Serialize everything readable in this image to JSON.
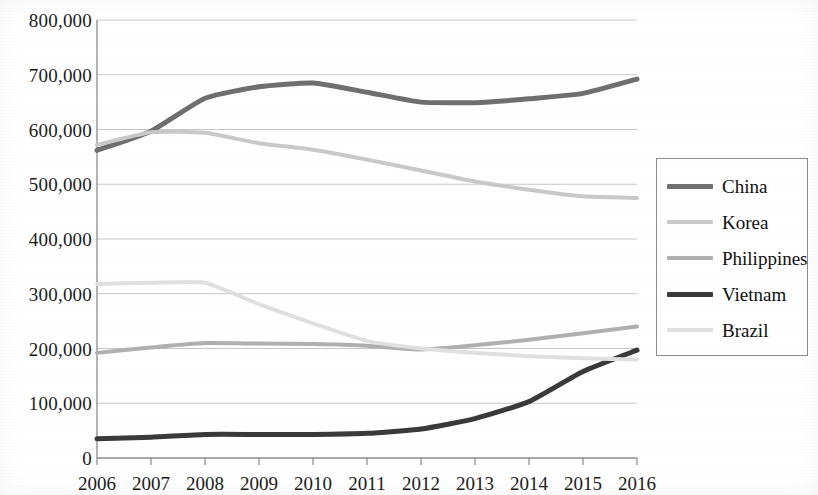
{
  "chart_data": {
    "type": "line",
    "title": "",
    "xlabel": "",
    "ylabel": "",
    "x": [
      2006,
      2007,
      2008,
      2009,
      2010,
      2011,
      2012,
      2013,
      2014,
      2015,
      2016
    ],
    "categories": [
      "2006",
      "2007",
      "2008",
      "2009",
      "2010",
      "2011",
      "2012",
      "2013",
      "2014",
      "2015",
      "2016"
    ],
    "xlim": [
      2006,
      2016
    ],
    "ylim": [
      0,
      800000
    ],
    "y_ticks": [
      0,
      100000,
      200000,
      300000,
      400000,
      500000,
      600000,
      700000,
      800000
    ],
    "y_tick_labels": [
      "0",
      "100,000",
      "200,000",
      "300,000",
      "400,000",
      "500,000",
      "600,000",
      "700,000",
      "800,000"
    ],
    "grid": true,
    "legend_position": "right",
    "series": [
      {
        "name": "China",
        "color": "#6f6f6f",
        "width": 5,
        "values": [
          562000,
          597000,
          657000,
          678000,
          685000,
          668000,
          650000,
          649000,
          656000,
          666000,
          692000
        ]
      },
      {
        "name": "Korea",
        "color": "#c9c9c9",
        "width": 4,
        "values": [
          572000,
          595000,
          594000,
          575000,
          563000,
          545000,
          525000,
          505000,
          490000,
          478000,
          475000
        ]
      },
      {
        "name": "Philippines",
        "color": "#b0b0b0",
        "width": 4,
        "values": [
          192000,
          202000,
          210000,
          209000,
          208000,
          205000,
          198000,
          206000,
          216000,
          228000,
          240000
        ]
      },
      {
        "name": "Vietnam",
        "color": "#3a3a3a",
        "width": 5,
        "values": [
          35000,
          38000,
          43000,
          43000,
          43000,
          45000,
          53000,
          72000,
          103000,
          158000,
          197000
        ]
      },
      {
        "name": "Brazil",
        "color": "#e0e0e0",
        "width": 4,
        "values": [
          318000,
          320000,
          320000,
          281000,
          246000,
          214000,
          200000,
          192000,
          186000,
          182000,
          180000
        ]
      }
    ]
  },
  "legend": {
    "items": [
      {
        "label": "China"
      },
      {
        "label": "Korea"
      },
      {
        "label": "Philippines"
      },
      {
        "label": "Vietnam"
      },
      {
        "label": "Brazil"
      }
    ]
  },
  "axes": {
    "y_labels": [
      "800,000",
      "700,000",
      "600,000",
      "500,000",
      "400,000",
      "300,000",
      "200,000",
      "100,000",
      "0"
    ],
    "x_labels": [
      "2006",
      "2007",
      "2008",
      "2009",
      "2010",
      "2011",
      "2012",
      "2013",
      "2014",
      "2015",
      "2016"
    ]
  }
}
